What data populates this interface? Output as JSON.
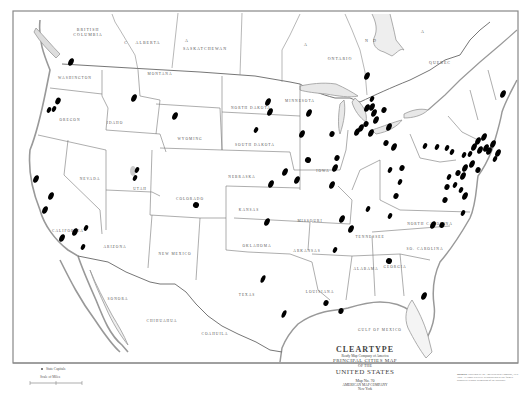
{
  "map": {
    "title": "CLEARTYPE",
    "subtitle_small": "Ready Map Company of America",
    "subtitle": "PRINCIPAL CITIES MAP",
    "of_the": "OF THE",
    "country": "UNITED STATES",
    "map_no": "Map No. 70",
    "publisher_line1": "AMERICAN MAP COMPANY",
    "publisher_line2": "New York",
    "legend_capitals": "State Capitals",
    "legend_scale": "Scale of Miles",
    "notice_label": "NOTICE",
    "notice_text": "Copyright by the American Map Company, New York. All rights reserved. Reproduction in any form is prohibited without permission of the publisher.",
    "colors": {
      "background": "#ffffff",
      "line": "#777777",
      "coast": "#999999",
      "dot": "#000000"
    },
    "labels": {
      "canada": [
        {
          "text": "BRITISH",
          "x": 88,
          "y": 31
        },
        {
          "text": "COLUMBIA",
          "x": 88,
          "y": 36
        },
        {
          "text": "C",
          "x": 126,
          "y": 44
        },
        {
          "text": "ALBERTA",
          "x": 148,
          "y": 44
        },
        {
          "text": "A",
          "x": 187,
          "y": 42
        },
        {
          "text": "SASKATCHEWAN",
          "x": 205,
          "y": 50
        },
        {
          "text": "A",
          "x": 306,
          "y": 46
        },
        {
          "text": "ONTARIO",
          "x": 340,
          "y": 60
        },
        {
          "text": "N",
          "x": 367,
          "y": 42
        },
        {
          "text": "D",
          "x": 375,
          "y": 42
        },
        {
          "text": "A",
          "x": 423,
          "y": 33
        },
        {
          "text": "QUEBEC",
          "x": 440,
          "y": 64
        }
      ],
      "states": [
        {
          "text": "WASHINGTON",
          "x": 75,
          "y": 79
        },
        {
          "text": "OREGON",
          "x": 70,
          "y": 121
        },
        {
          "text": "IDAHO",
          "x": 115,
          "y": 124
        },
        {
          "text": "MONTANA",
          "x": 160,
          "y": 75
        },
        {
          "text": "WYOMING",
          "x": 190,
          "y": 140
        },
        {
          "text": "NORTH DAKOTA",
          "x": 251,
          "y": 109
        },
        {
          "text": "SOUTH DAKOTA",
          "x": 255,
          "y": 146
        },
        {
          "text": "MINNESOTA",
          "x": 300,
          "y": 102
        },
        {
          "text": "NEVADA",
          "x": 90,
          "y": 180
        },
        {
          "text": "UTAH",
          "x": 140,
          "y": 190
        },
        {
          "text": "COLORADO",
          "x": 190,
          "y": 200
        },
        {
          "text": "NEBRASKA",
          "x": 242,
          "y": 178
        },
        {
          "text": "IOWA",
          "x": 323,
          "y": 172
        },
        {
          "text": "CALIFORNIA",
          "x": 68,
          "y": 232
        },
        {
          "text": "ARIZONA",
          "x": 115,
          "y": 248
        },
        {
          "text": "NEW MEXICO",
          "x": 175,
          "y": 255
        },
        {
          "text": "KANSAS",
          "x": 249,
          "y": 211
        },
        {
          "text": "MISSOURI",
          "x": 310,
          "y": 222
        },
        {
          "text": "OKLAHOMA",
          "x": 257,
          "y": 247
        },
        {
          "text": "ARKANSAS",
          "x": 307,
          "y": 252
        },
        {
          "text": "TEXAS",
          "x": 247,
          "y": 296
        },
        {
          "text": "LOUISIANA",
          "x": 320,
          "y": 293
        },
        {
          "text": "ALABAMA",
          "x": 366,
          "y": 270
        },
        {
          "text": "GEORGIA",
          "x": 395,
          "y": 268
        },
        {
          "text": "SO. CAROLINA",
          "x": 425,
          "y": 250
        },
        {
          "text": "NORTH CAROLINA",
          "x": 430,
          "y": 225
        },
        {
          "text": "TENNESSEE",
          "x": 370,
          "y": 238
        },
        {
          "text": "SONORA",
          "x": 118,
          "y": 300
        },
        {
          "text": "CHIHUAHUA",
          "x": 162,
          "y": 322
        },
        {
          "text": "COAHUILA",
          "x": 215,
          "y": 335
        },
        {
          "text": "GULF OF MEXICO",
          "x": 380,
          "y": 331
        }
      ]
    },
    "cities": [
      {
        "x": 71,
        "y": 62,
        "rx": 2.5,
        "ry": 4
      },
      {
        "x": 58,
        "y": 101,
        "rx": 2.5,
        "ry": 3.5
      },
      {
        "x": 49,
        "y": 110,
        "rx": 2,
        "ry": 3
      },
      {
        "x": 54,
        "y": 109,
        "rx": 2,
        "ry": 3
      },
      {
        "x": 134,
        "y": 98,
        "rx": 2.5,
        "ry": 4
      },
      {
        "x": 175,
        "y": 116,
        "rx": 2.5,
        "ry": 4
      },
      {
        "x": 268,
        "y": 102,
        "rx": 2.5,
        "ry": 4
      },
      {
        "x": 270,
        "y": 112,
        "rx": 2.5,
        "ry": 4
      },
      {
        "x": 256,
        "y": 130,
        "rx": 2,
        "ry": 3
      },
      {
        "x": 309,
        "y": 113,
        "rx": 2.5,
        "ry": 4
      },
      {
        "x": 302,
        "y": 134,
        "rx": 2.5,
        "ry": 4
      },
      {
        "x": 332,
        "y": 134,
        "rx": 2.5,
        "ry": 3
      },
      {
        "x": 308,
        "y": 160,
        "rx": 3,
        "ry": 3
      },
      {
        "x": 285,
        "y": 172,
        "rx": 2.5,
        "ry": 4
      },
      {
        "x": 297,
        "y": 180,
        "rx": 2.5,
        "ry": 4
      },
      {
        "x": 271,
        "y": 184,
        "rx": 2.5,
        "ry": 4
      },
      {
        "x": 337,
        "y": 158,
        "rx": 2.5,
        "ry": 3
      },
      {
        "x": 335,
        "y": 168,
        "rx": 2.5,
        "ry": 4
      },
      {
        "x": 332,
        "y": 185,
        "rx": 2.5,
        "ry": 4
      },
      {
        "x": 196,
        "y": 205,
        "rx": 3,
        "ry": 3
      },
      {
        "x": 137,
        "y": 170,
        "rx": 2,
        "ry": 3
      },
      {
        "x": 135,
        "y": 178,
        "rx": 2,
        "ry": 3
      },
      {
        "x": 36,
        "y": 179,
        "rx": 2.5,
        "ry": 4
      },
      {
        "x": 51,
        "y": 196,
        "rx": 2.5,
        "ry": 4
      },
      {
        "x": 45,
        "y": 210,
        "rx": 2.5,
        "ry": 4
      },
      {
        "x": 75,
        "y": 232,
        "rx": 2.5,
        "ry": 4
      },
      {
        "x": 86,
        "y": 228,
        "rx": 2,
        "ry": 3
      },
      {
        "x": 62,
        "y": 238,
        "rx": 2.5,
        "ry": 4
      },
      {
        "x": 83,
        "y": 247,
        "rx": 2,
        "ry": 3
      },
      {
        "x": 367,
        "y": 76,
        "rx": 2.5,
        "ry": 4
      },
      {
        "x": 372,
        "y": 99,
        "rx": 2,
        "ry": 3
      },
      {
        "x": 372,
        "y": 107,
        "rx": 2.5,
        "ry": 4
      },
      {
        "x": 367,
        "y": 108,
        "rx": 2.5,
        "ry": 4
      },
      {
        "x": 384,
        "y": 110,
        "rx": 2.5,
        "ry": 3
      },
      {
        "x": 374,
        "y": 113,
        "rx": 2.5,
        "ry": 4
      },
      {
        "x": 376,
        "y": 120,
        "rx": 2.5,
        "ry": 4
      },
      {
        "x": 389,
        "y": 127,
        "rx": 2.5,
        "ry": 4
      },
      {
        "x": 366,
        "y": 124,
        "rx": 2.5,
        "ry": 3
      },
      {
        "x": 361,
        "y": 128,
        "rx": 2.5,
        "ry": 4
      },
      {
        "x": 357,
        "y": 132,
        "rx": 2.5,
        "ry": 4
      },
      {
        "x": 371,
        "y": 133,
        "rx": 2.5,
        "ry": 4
      },
      {
        "x": 386,
        "y": 143,
        "rx": 2.5,
        "ry": 3
      },
      {
        "x": 394,
        "y": 147,
        "rx": 2.5,
        "ry": 4
      },
      {
        "x": 425,
        "y": 146,
        "rx": 2,
        "ry": 3
      },
      {
        "x": 437,
        "y": 147,
        "rx": 2,
        "ry": 3
      },
      {
        "x": 447,
        "y": 148,
        "rx": 2,
        "ry": 3
      },
      {
        "x": 452,
        "y": 152,
        "rx": 2,
        "ry": 3
      },
      {
        "x": 464,
        "y": 155,
        "rx": 2,
        "ry": 3
      },
      {
        "x": 470,
        "y": 154,
        "rx": 2,
        "ry": 3
      },
      {
        "x": 465,
        "y": 168,
        "rx": 2.5,
        "ry": 4
      },
      {
        "x": 463,
        "y": 176,
        "rx": 2.5,
        "ry": 4
      },
      {
        "x": 458,
        "y": 173,
        "rx": 2.5,
        "ry": 3
      },
      {
        "x": 455,
        "y": 185,
        "rx": 2,
        "ry": 3
      },
      {
        "x": 461,
        "y": 190,
        "rx": 2,
        "ry": 3
      },
      {
        "x": 465,
        "y": 196,
        "rx": 2.5,
        "ry": 4
      },
      {
        "x": 478,
        "y": 170,
        "rx": 2.5,
        "ry": 3
      },
      {
        "x": 472,
        "y": 164,
        "rx": 2.5,
        "ry": 4
      },
      {
        "x": 474,
        "y": 147,
        "rx": 2.5,
        "ry": 4
      },
      {
        "x": 478,
        "y": 141,
        "rx": 2.5,
        "ry": 4
      },
      {
        "x": 484,
        "y": 137,
        "rx": 2.5,
        "ry": 4
      },
      {
        "x": 486,
        "y": 148,
        "rx": 2.5,
        "ry": 4
      },
      {
        "x": 489,
        "y": 151,
        "rx": 2.5,
        "ry": 4
      },
      {
        "x": 480,
        "y": 150,
        "rx": 2.5,
        "ry": 4
      },
      {
        "x": 495,
        "y": 159,
        "rx": 2,
        "ry": 3
      },
      {
        "x": 493,
        "y": 144,
        "rx": 2.5,
        "ry": 4
      },
      {
        "x": 498,
        "y": 153,
        "rx": 2.5,
        "ry": 4
      },
      {
        "x": 503,
        "y": 94,
        "rx": 2.5,
        "ry": 4
      },
      {
        "x": 449,
        "y": 177,
        "rx": 2,
        "ry": 3
      },
      {
        "x": 447,
        "y": 187,
        "rx": 2.5,
        "ry": 3
      },
      {
        "x": 445,
        "y": 200,
        "rx": 2.5,
        "ry": 3
      },
      {
        "x": 433,
        "y": 225,
        "rx": 2.5,
        "ry": 4
      },
      {
        "x": 442,
        "y": 225,
        "rx": 2.5,
        "ry": 3
      },
      {
        "x": 463,
        "y": 213,
        "rx": 2,
        "ry": 3
      },
      {
        "x": 390,
        "y": 216,
        "rx": 2,
        "ry": 3
      },
      {
        "x": 400,
        "y": 182,
        "rx": 2,
        "ry": 3
      },
      {
        "x": 396,
        "y": 196,
        "rx": 2.5,
        "ry": 3
      },
      {
        "x": 402,
        "y": 168,
        "rx": 2.5,
        "ry": 3
      },
      {
        "x": 390,
        "y": 170,
        "rx": 2,
        "ry": 3
      },
      {
        "x": 351,
        "y": 229,
        "rx": 2.5,
        "ry": 4
      },
      {
        "x": 368,
        "y": 209,
        "rx": 2,
        "ry": 3
      },
      {
        "x": 389,
        "y": 261,
        "rx": 3,
        "ry": 3
      },
      {
        "x": 424,
        "y": 296,
        "rx": 2.5,
        "ry": 4
      },
      {
        "x": 267,
        "y": 222,
        "rx": 2.5,
        "ry": 4
      },
      {
        "x": 342,
        "y": 219,
        "rx": 2.5,
        "ry": 4
      },
      {
        "x": 335,
        "y": 250,
        "rx": 2,
        "ry": 3
      },
      {
        "x": 263,
        "y": 279,
        "rx": 2,
        "ry": 4
      },
      {
        "x": 284,
        "y": 314,
        "rx": 2,
        "ry": 4
      },
      {
        "x": 326,
        "y": 303,
        "rx": 2.5,
        "ry": 3
      },
      {
        "x": 341,
        "y": 311,
        "rx": 2.5,
        "ry": 3
      }
    ]
  }
}
